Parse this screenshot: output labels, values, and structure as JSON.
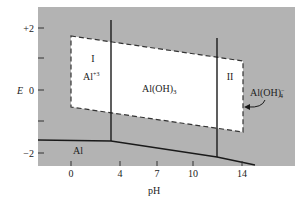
{
  "diagram": {
    "title": "",
    "type": "pourbaix",
    "y_axis": {
      "label": "E",
      "ticks": [
        {
          "value": "+2",
          "y": 28
        },
        {
          "value": "",
          "y": 58
        },
        {
          "value": "0",
          "y": 90
        },
        {
          "value": "",
          "y": 121
        },
        {
          "value": "−2",
          "y": 153
        }
      ]
    },
    "x_axis": {
      "label": "pH",
      "ticks": [
        {
          "value": "0",
          "x": 71
        },
        {
          "value": "4",
          "x": 120
        },
        {
          "value": "7",
          "x": 157
        },
        {
          "value": "10",
          "x": 193
        },
        {
          "value": "14",
          "x": 242
        }
      ]
    },
    "regions": {
      "region_i_label": "I",
      "al3_label": "Al",
      "al3_sup": "+3",
      "aloh3_label": "Al(OH)",
      "aloh3_sub": "3",
      "region_ii_label": "II",
      "aloh4_label": "Al(OH)",
      "aloh4_sub": "4",
      "aloh4_sup": "−",
      "al_metal_label": "Al"
    },
    "colors": {
      "panel": "#b3b3b3",
      "stable_region": "#ffffff",
      "lines": "#1a1a1a"
    }
  }
}
